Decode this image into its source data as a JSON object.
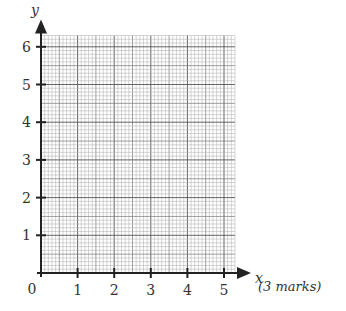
{
  "chart_data": {
    "type": "scatter",
    "title": "",
    "xlabel": "x",
    "ylabel": "y",
    "xlim": [
      0,
      5.3
    ],
    "ylim": [
      0,
      6.3
    ],
    "x_ticks": [
      1,
      2,
      3,
      4,
      5
    ],
    "y_ticks": [
      1,
      2,
      3,
      4,
      5,
      6
    ],
    "origin_label": "0",
    "grid": true,
    "minor_grid_step": 0.1,
    "mid_grid_step": 0.5,
    "major_grid_step": 1,
    "series": []
  },
  "marks_label": "(3 marks)"
}
